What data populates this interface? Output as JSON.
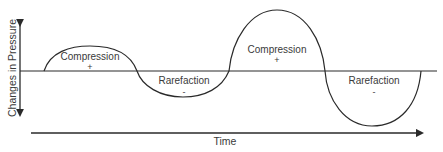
{
  "diagram": {
    "y_axis_label": "Changes in Pressure",
    "x_axis_label": "Time",
    "regions": [
      {
        "label": "Compression",
        "sign": "+"
      },
      {
        "label": "Rarefaction",
        "sign": "-"
      },
      {
        "label": "Compression",
        "sign": "+"
      },
      {
        "label": "Rarefaction",
        "sign": "-"
      }
    ],
    "colors": {
      "line": "#2a2a2a",
      "text": "#3a3a3a",
      "background": "#ffffff"
    }
  }
}
